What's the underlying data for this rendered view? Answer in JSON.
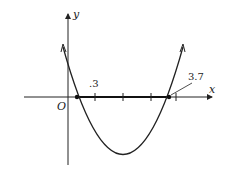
{
  "diagram": {
    "type": "parabola-graph",
    "axes": {
      "x_label": "x",
      "y_label": "y",
      "origin_label": "O"
    },
    "annotations": {
      "left_root_label": ".3",
      "right_root_label": "3.7",
      "right_tick_label": "4"
    }
  }
}
